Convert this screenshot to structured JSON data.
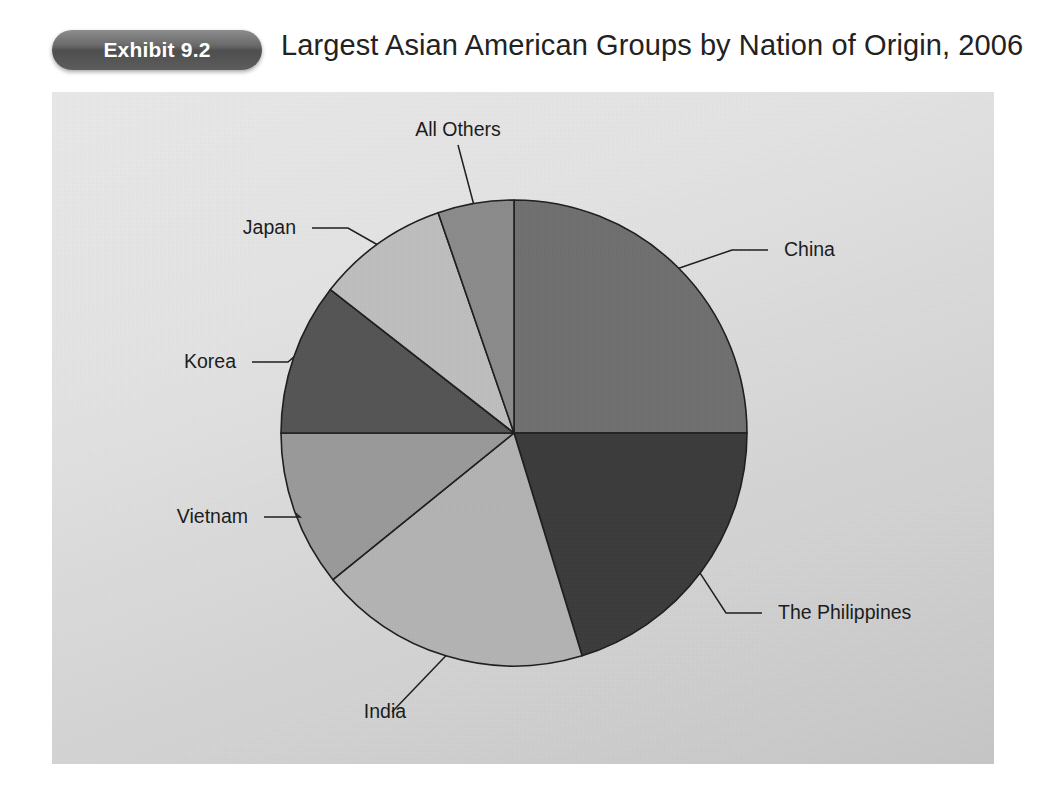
{
  "header": {
    "badge_label": "Exhibit 9.2",
    "title": "Largest Asian American Groups by Nation of Origin, 2006"
  },
  "chart_data": {
    "type": "pie",
    "title": "Largest Asian American Groups by Nation of Origin, 2006",
    "xlabel": "",
    "ylabel": "",
    "legend_position": "none",
    "labels_position": "outside-with-leader-lines",
    "start_angle_deg": 0,
    "direction": "clockwise",
    "categories": [
      "China",
      "The Philippines",
      "India",
      "Vietnam",
      "Korea",
      "Japan",
      "All Others"
    ],
    "values": [
      25.0,
      20.3,
      18.9,
      10.8,
      10.6,
      9.2,
      5.2
    ],
    "value_unit": "percent",
    "slices": [
      {
        "label": "China",
        "value": 25.0,
        "angle_deg": 90,
        "start_deg": 0,
        "end_deg": 90,
        "color": "#6f6f6f"
      },
      {
        "label": "The Philippines",
        "value": 20.3,
        "angle_deg": 73,
        "start_deg": 90,
        "end_deg": 163,
        "color": "#3b3b3b"
      },
      {
        "label": "India",
        "value": 18.9,
        "angle_deg": 68,
        "start_deg": 163,
        "end_deg": 231,
        "color": "#b3b3b3"
      },
      {
        "label": "Vietnam",
        "value": 10.8,
        "angle_deg": 39,
        "start_deg": 231,
        "end_deg": 270,
        "color": "#9a9a9a"
      },
      {
        "label": "Korea",
        "value": 10.6,
        "angle_deg": 38,
        "start_deg": 270,
        "end_deg": 308,
        "color": "#545454"
      },
      {
        "label": "Japan",
        "value": 9.2,
        "angle_deg": 33,
        "start_deg": 308,
        "end_deg": 341,
        "color": "#bebebe"
      },
      {
        "label": "All Others",
        "value": 5.2,
        "angle_deg": 19,
        "start_deg": 341,
        "end_deg": 360,
        "color": "#8b8b8b"
      }
    ]
  },
  "colors": {
    "panel_background": "#e2e2e2",
    "badge_fill": "#5d5d5d",
    "badge_text": "#ffffff",
    "title_text": "#222222",
    "outline": "#1d1d1d"
  }
}
